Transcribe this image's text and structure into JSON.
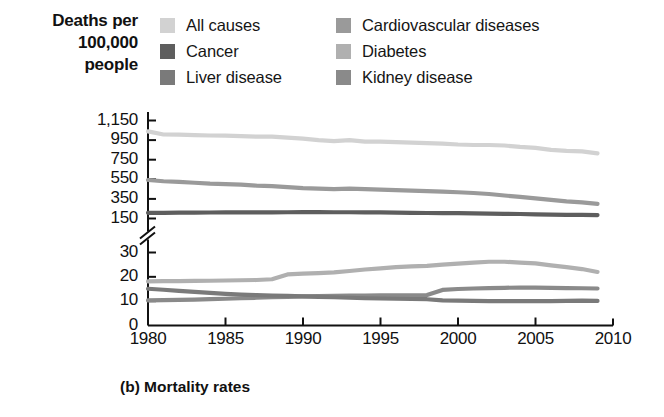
{
  "axis_title": {
    "line1": "Deaths per",
    "line2": "100,000",
    "line3": "people"
  },
  "caption": "(b) Mortality rates",
  "legend": {
    "left": [
      {
        "label": "All causes",
        "color": "#d2d2d2",
        "name": "all-causes"
      },
      {
        "label": "Cancer",
        "color": "#5e5e5e",
        "name": "cancer"
      },
      {
        "label": "Liver disease",
        "color": "#7a7a7a",
        "name": "liver-disease"
      }
    ],
    "right": [
      {
        "label": "Cardiovascular diseases",
        "color": "#9a9a9a",
        "name": "cardiovascular-diseases"
      },
      {
        "label": "Diabetes",
        "color": "#b0b0b0",
        "name": "diabetes"
      },
      {
        "label": "Kidney disease",
        "color": "#8a8a8a",
        "name": "kidney-disease"
      }
    ]
  },
  "chart_data": {
    "type": "line",
    "title": "(b) Mortality rates",
    "xlabel": "",
    "ylabel": "Deaths per 100,000 people",
    "grid": false,
    "legend_position": "top",
    "broken_axis": true,
    "axis_note": "y-axis is broken between 150 and 30",
    "x": [
      1980,
      1981,
      1982,
      1983,
      1984,
      1985,
      1986,
      1987,
      1988,
      1989,
      1990,
      1991,
      1992,
      1993,
      1994,
      1995,
      1996,
      1997,
      1998,
      1999,
      2000,
      2001,
      2002,
      2003,
      2004,
      2005,
      2006,
      2007,
      2008,
      2009
    ],
    "xlim": [
      1980,
      2010
    ],
    "xticks": [
      1980,
      1985,
      1990,
      1995,
      2000,
      2005,
      2010
    ],
    "yticks_upper": [
      150,
      350,
      550,
      750,
      950,
      1150
    ],
    "yticks_lower": [
      0,
      10,
      20,
      30
    ],
    "ylim_upper": [
      150,
      1150
    ],
    "ylim_lower": [
      0,
      30
    ],
    "series": [
      {
        "name": "All causes",
        "color": "#d2d2d2",
        "panel": "upper",
        "values": [
          1039,
          1007,
          1005,
          1000,
          997,
          995,
          990,
          985,
          985,
          975,
          965,
          950,
          940,
          950,
          935,
          935,
          930,
          925,
          920,
          915,
          905,
          900,
          900,
          895,
          880,
          870,
          850,
          840,
          835,
          815
        ]
      },
      {
        "name": "Cardiovascular diseases",
        "color": "#9a9a9a",
        "panel": "upper",
        "values": [
          543,
          530,
          523,
          515,
          505,
          500,
          495,
          485,
          480,
          470,
          460,
          455,
          450,
          455,
          450,
          445,
          440,
          435,
          430,
          425,
          418,
          410,
          400,
          385,
          370,
          355,
          340,
          325,
          315,
          300
        ]
      },
      {
        "name": "Cancer",
        "color": "#5e5e5e",
        "panel": "upper",
        "values": [
          208,
          208,
          209,
          210,
          211,
          212,
          212,
          212,
          213,
          214,
          215,
          215,
          214,
          214,
          213,
          212,
          210,
          208,
          206,
          205,
          204,
          202,
          200,
          198,
          196,
          193,
          190,
          188,
          186,
          185
        ]
      },
      {
        "name": "Diabetes",
        "color": "#b0b0b0",
        "panel": "lower",
        "values": [
          18.1,
          18.2,
          18.2,
          18.3,
          18.4,
          18.5,
          18.6,
          18.7,
          19.0,
          21.0,
          21.3,
          21.5,
          21.8,
          22.4,
          23.0,
          23.5,
          24.0,
          24.3,
          24.5,
          25.0,
          25.4,
          25.8,
          26.2,
          26.2,
          25.8,
          25.5,
          24.7,
          24.0,
          23.2,
          22.0
        ]
      },
      {
        "name": "Kidney disease",
        "color": "#8a8a8a",
        "panel": "lower",
        "values": [
          10.3,
          10.4,
          10.5,
          10.6,
          10.8,
          11.0,
          11.2,
          11.4,
          11.6,
          11.8,
          12.0,
          12.1,
          12.2,
          12.3,
          12.3,
          12.4,
          12.4,
          12.4,
          12.5,
          14.6,
          15.0,
          15.2,
          15.4,
          15.5,
          15.6,
          15.6,
          15.5,
          15.4,
          15.3,
          15.2
        ]
      },
      {
        "name": "Liver disease",
        "color": "#7a7a7a",
        "panel": "lower",
        "values": [
          15.1,
          14.7,
          14.2,
          13.8,
          13.4,
          13.0,
          12.7,
          12.5,
          12.3,
          12.2,
          12.0,
          11.8,
          11.6,
          11.4,
          11.2,
          11.1,
          11.0,
          10.9,
          10.8,
          10.3,
          10.2,
          10.1,
          10.0,
          10.0,
          10.0,
          10.0,
          10.0,
          10.1,
          10.2,
          10.1
        ]
      }
    ]
  }
}
